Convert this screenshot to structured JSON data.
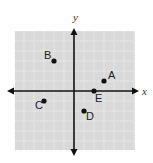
{
  "chart_data": {
    "type": "scatter",
    "title": "",
    "xlabel": "x",
    "ylabel": "y",
    "xlim": [
      -6,
      6
    ],
    "ylim": [
      -6,
      6
    ],
    "grid": true,
    "points": [
      {
        "label": "A",
        "x": 3,
        "y": 1
      },
      {
        "label": "B",
        "x": -2,
        "y": 3
      },
      {
        "label": "C",
        "x": -3,
        "y": -1
      },
      {
        "label": "D",
        "x": 1,
        "y": -2
      },
      {
        "label": "E",
        "x": 2,
        "y": 0
      }
    ]
  },
  "axes": {
    "x_label": "x",
    "y_label": "y"
  },
  "colors": {
    "grid_bg": "#d9d9d9",
    "grid_line": "#f2f2f2",
    "axis": "#111111",
    "point": "#111111"
  }
}
